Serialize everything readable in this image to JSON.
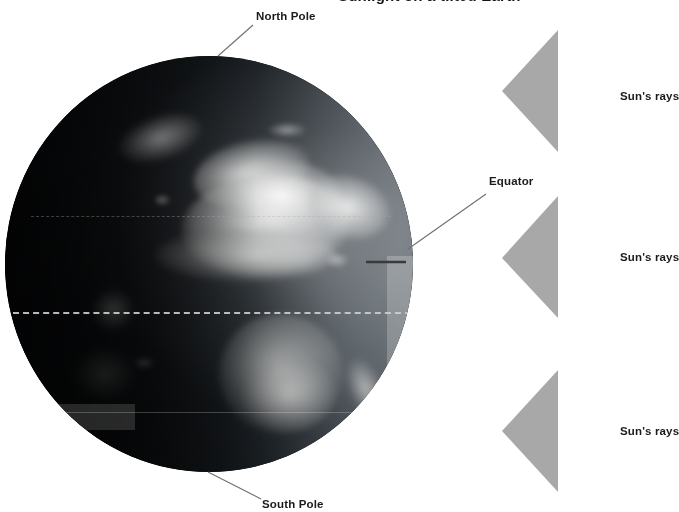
{
  "diagram": {
    "title_fragment": "Sunlight on a tilted Earth"
  },
  "globe": {
    "name": "earth-globe",
    "center_x": 209,
    "center_y": 264,
    "radius": 204,
    "visible_continents": "Africa, Europe, Arabia, Madagascar",
    "terminator_note": "sunlit limb on right, night side on left"
  },
  "latitude_lines": [
    {
      "name": "equator-line",
      "label": "Equator",
      "y": 256,
      "style": "dashed"
    },
    {
      "name": "tropic-south",
      "label": "Tropic of Capricorn",
      "y": 356,
      "style": "solid"
    },
    {
      "name": "tropic-north",
      "label": "Tropic of Cancer",
      "y": 160,
      "style": "dashed"
    }
  ],
  "labels": {
    "north_pole": "North Pole",
    "south_pole": "South Pole",
    "equator": "Equator"
  },
  "sun_rays": [
    {
      "name": "sun-ray-top",
      "label": "Sun's rays",
      "tip_x": 502,
      "tip_y": 91,
      "base_x": 558,
      "base_top": 30,
      "base_bottom": 152
    },
    {
      "name": "sun-ray-middle",
      "label": "Sun's rays",
      "tip_x": 502,
      "tip_y": 258,
      "base_x": 558,
      "base_top": 196,
      "base_bottom": 318
    },
    {
      "name": "sun-ray-bottom",
      "label": "Sun's rays",
      "tip_x": 502,
      "tip_y": 431,
      "base_x": 558,
      "base_top": 370,
      "base_bottom": 492
    }
  ],
  "colors": {
    "background": "#ffffff",
    "ray_fill": "#a8a8a8",
    "text": "#1b1b1b",
    "leader_line": "#6f6f6f",
    "latitude_line": "#c8c8c8"
  }
}
